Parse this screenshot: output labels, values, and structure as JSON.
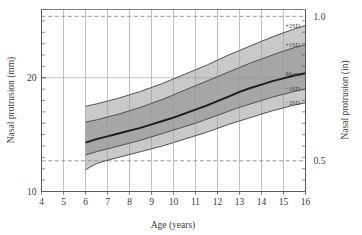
{
  "chart_data": {
    "type": "area",
    "title": "",
    "xlabel": "Age (years)",
    "ylabel": "Nasal protrusion (mm)",
    "ylabel_right": "Nasal protrusion (in)",
    "xlim": [
      4,
      16
    ],
    "ylim": [
      10,
      26
    ],
    "ylim_right": [
      0.3937,
      1.0236
    ],
    "grid": true,
    "legend_position": "right-axis-annotations",
    "x_ticks": [
      4,
      5,
      6,
      7,
      8,
      9,
      10,
      11,
      12,
      13,
      14,
      15,
      16
    ],
    "x_tick_labels": [
      "4",
      "5",
      "6",
      "7",
      "8",
      "9",
      "10",
      "11",
      "12",
      "13",
      "14",
      "15",
      "16"
    ],
    "y_ticks_major": [
      10,
      20
    ],
    "y_tick_labels": [
      "10",
      "20"
    ],
    "y_ticks_minor": [
      11,
      12,
      13,
      14,
      15,
      16,
      17,
      18,
      19,
      21,
      22,
      23,
      24,
      25
    ],
    "y_right_ticks": [
      0.5,
      1.0
    ],
    "y_right_tick_labels": [
      "0.5",
      "1.0"
    ],
    "reference_lines": [
      {
        "value_in": 1.0,
        "value_mm": 25.4,
        "style": "dashed"
      },
      {
        "value_in": 0.5,
        "value_mm": 12.7,
        "style": "dashed"
      }
    ],
    "x": [
      6,
      6.25,
      6.5,
      7,
      7.5,
      8,
      8.5,
      9,
      9.5,
      10,
      10.5,
      11,
      11.5,
      12,
      12.5,
      13,
      13.5,
      14,
      14.5,
      15,
      15.5,
      16
    ],
    "series": [
      {
        "name": "+2SD",
        "label": "+2SD",
        "values": [
          17.5,
          17.6,
          17.7,
          17.95,
          18.2,
          18.5,
          18.8,
          19.15,
          19.5,
          19.9,
          20.3,
          20.7,
          21.1,
          21.55,
          22.0,
          22.4,
          22.8,
          23.2,
          23.6,
          23.95,
          24.3,
          24.6
        ]
      },
      {
        "name": "+1SD",
        "label": "+1SD",
        "values": [
          16.1,
          16.2,
          16.3,
          16.55,
          16.8,
          17.1,
          17.4,
          17.75,
          18.1,
          18.5,
          18.9,
          19.3,
          19.7,
          20.1,
          20.5,
          20.9,
          21.3,
          21.65,
          22.0,
          22.35,
          22.65,
          22.9
        ]
      },
      {
        "name": "Mean",
        "label": "Mean",
        "values": [
          14.3,
          14.45,
          14.6,
          14.85,
          15.1,
          15.35,
          15.6,
          15.9,
          16.2,
          16.5,
          16.85,
          17.2,
          17.55,
          17.95,
          18.35,
          18.75,
          19.1,
          19.4,
          19.7,
          19.95,
          20.2,
          20.4
        ]
      },
      {
        "name": "-1SD",
        "label": "−1SD",
        "values": [
          13.2,
          13.35,
          13.5,
          13.75,
          14.0,
          14.25,
          14.5,
          14.8,
          15.1,
          15.4,
          15.7,
          16.0,
          16.35,
          16.7,
          17.05,
          17.4,
          17.7,
          18.0,
          18.3,
          18.55,
          18.8,
          19.0
        ]
      },
      {
        "name": "-2SD",
        "label": "−2SD",
        "values": [
          11.9,
          12.2,
          12.45,
          12.75,
          13.0,
          13.25,
          13.5,
          13.75,
          14.0,
          14.3,
          14.6,
          14.9,
          15.2,
          15.55,
          15.9,
          16.2,
          16.5,
          16.8,
          17.1,
          17.35,
          17.6,
          17.8
        ]
      }
    ],
    "bands": [
      {
        "name": "outer-upper",
        "from": "+1SD",
        "to": "+2SD",
        "color": "#c9c9c9"
      },
      {
        "name": "inner-upper",
        "from": "Mean",
        "to": "+1SD",
        "color": "#a6a6a6"
      },
      {
        "name": "inner-lower",
        "from": "-1SD",
        "to": "Mean",
        "color": "#a6a6a6"
      },
      {
        "name": "outer-lower",
        "from": "-2SD",
        "to": "-1SD",
        "color": "#c9c9c9"
      }
    ],
    "colors": {
      "band_outer": "#c9c9c9",
      "band_inner": "#a6a6a6",
      "mean_line": "#1a1a1a",
      "sd_line": "#404040",
      "grid": "#9a9a9a",
      "axis": "#5a5a5a",
      "dashed_reference": "#8c8c8c",
      "background": "#ffffff",
      "text": "#3a3a3a"
    }
  }
}
